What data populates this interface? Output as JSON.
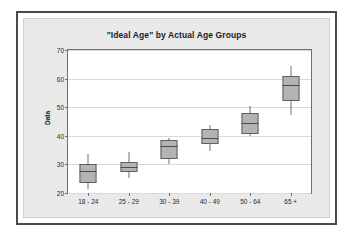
{
  "chart_data": {
    "type": "box",
    "title": "\"Ideal Age\"  by Actual Age Groups",
    "xlabel": "",
    "ylabel": "Data",
    "ylim": [
      20,
      70
    ],
    "yticks": [
      20,
      30,
      40,
      50,
      60,
      70
    ],
    "grid": true,
    "legend": "none",
    "categories": [
      "18 - 24",
      "25 - 29",
      "30 - 39",
      "40 - 49",
      "50 - 64",
      "65 +"
    ],
    "boxes": [
      {
        "category": "18 - 24",
        "whisker_low": 21.3,
        "q1": 23.6,
        "median": 27.6,
        "q3": 30.0,
        "whisker_high": 33.5
      },
      {
        "category": "25 - 29",
        "whisker_low": 25.2,
        "q1": 27.2,
        "median": 29.0,
        "q3": 31.0,
        "whisker_high": 34.2
      },
      {
        "category": "30 - 39",
        "whisker_low": 30.0,
        "q1": 32.0,
        "median": 36.3,
        "q3": 38.7,
        "whisker_high": 39.3
      },
      {
        "category": "40 - 49",
        "whisker_low": 34.8,
        "q1": 37.2,
        "median": 39.2,
        "q3": 42.3,
        "whisker_high": 43.9
      },
      {
        "category": "50 - 64",
        "whisker_low": 40.0,
        "q1": 40.8,
        "median": 44.6,
        "q3": 47.8,
        "whisker_high": 50.3
      },
      {
        "category": "65 +",
        "whisker_low": 47.4,
        "q1": 52.3,
        "median": 57.9,
        "q3": 60.9,
        "whisker_high": 64.3
      }
    ],
    "colors": {
      "box_fill": "#b4b4b4",
      "box_border": "#5f5f5f",
      "whisker": "#707070",
      "median": "#4a4a4a",
      "plot_background": "#ffffff",
      "canvas_background": "#e9e9e9",
      "frame_border": "#4a4a4a",
      "gridline": "#d9d9d9",
      "axis": "#6f6f6f",
      "text": "#1c1c1c"
    }
  }
}
